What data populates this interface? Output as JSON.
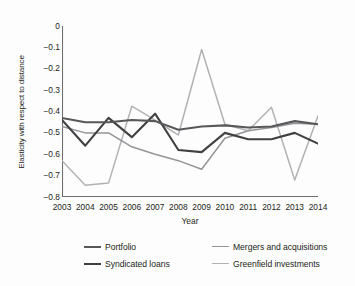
{
  "chart_data": {
    "type": "line",
    "title": "",
    "xlabel": "Year",
    "ylabel": "Elasticity with respect to distance",
    "categories": [
      "2003",
      "2004",
      "2005",
      "2006",
      "2007",
      "2008",
      "2009",
      "2010",
      "2011",
      "2012",
      "2013",
      "2014"
    ],
    "x": [
      2003,
      2004,
      2005,
      2006,
      2007,
      2008,
      2009,
      2010,
      2011,
      2012,
      2013,
      2014
    ],
    "xlim": [
      2003,
      2014
    ],
    "ylim": [
      -0.8,
      0
    ],
    "yticks": [
      "0",
      "−0.1",
      "−0.2",
      "−0.3",
      "−0.4",
      "−0.5",
      "−0.6",
      "−0.7",
      "−0.8"
    ],
    "ytick_values": [
      0,
      -0.1,
      -0.2,
      -0.3,
      -0.4,
      -0.5,
      -0.6,
      -0.7,
      -0.8
    ],
    "grid": false,
    "legend_position": "below",
    "series": [
      {
        "name": "Portfolio",
        "color": "#58585b",
        "values": [
          -0.43,
          -0.45,
          -0.45,
          -0.44,
          -0.445,
          -0.485,
          -0.47,
          -0.465,
          -0.475,
          -0.47,
          -0.445,
          -0.46
        ]
      },
      {
        "name": "Syndicated loans",
        "color": "#414042",
        "values": [
          -0.44,
          -0.56,
          -0.43,
          -0.52,
          -0.41,
          -0.58,
          -0.59,
          -0.5,
          -0.53,
          -0.53,
          -0.5,
          -0.55
        ]
      },
      {
        "name": "Mergers and acquisitions",
        "color": "#939598",
        "values": [
          -0.47,
          -0.5,
          -0.5,
          -0.565,
          -0.6,
          -0.63,
          -0.67,
          -0.525,
          -0.49,
          -0.475,
          -0.455,
          -0.46
        ]
      },
      {
        "name": "Greenfield investments",
        "color": "#b0b2b4",
        "values": [
          -0.63,
          -0.745,
          -0.735,
          -0.375,
          -0.44,
          -0.51,
          -0.11,
          -0.46,
          -0.49,
          -0.38,
          -0.72,
          -0.42
        ]
      }
    ]
  },
  "axis": {
    "x_title": "Year",
    "y_title": "Elasticity with respect to distance"
  },
  "legend": {
    "items": [
      {
        "label": "Portfolio"
      },
      {
        "label": "Syndicated loans"
      },
      {
        "label": "Mergers and acquisitions"
      },
      {
        "label": "Greenfield investments"
      }
    ]
  },
  "colors": {
    "axis": "#6d6e71",
    "text": "#231f20",
    "background": "#fdfdfd"
  }
}
